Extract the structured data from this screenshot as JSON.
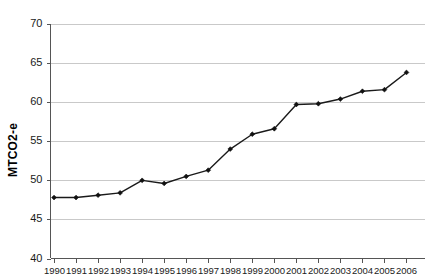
{
  "chart_data": {
    "type": "line",
    "title": "",
    "subtitle": "",
    "xlabel": "",
    "ylabel": "MTCO2-e",
    "ylim": [
      40,
      70
    ],
    "ytick_step": 5,
    "yticks": [
      40,
      45,
      50,
      55,
      60,
      65,
      70
    ],
    "grid": true,
    "legend": "none",
    "marker": "diamond",
    "line_color": "#1a1a1a",
    "grid_color": "#c9c9c9",
    "axis_color": "#555555",
    "background_color": "#ffffff",
    "categories": [
      "1990",
      "1991",
      "1992",
      "1993",
      "1994",
      "1995",
      "1996",
      "1997",
      "1998",
      "1999",
      "2000",
      "2001",
      "2002",
      "2003",
      "2004",
      "2005",
      "2006"
    ],
    "values": [
      47.8,
      47.8,
      48.1,
      48.4,
      50.0,
      49.6,
      50.5,
      51.3,
      54.0,
      55.9,
      56.6,
      59.7,
      59.8,
      60.4,
      61.4,
      61.6,
      63.8
    ],
    "series": [
      {
        "name": "MTCO2-e",
        "values": [
          47.8,
          47.8,
          48.1,
          48.4,
          50.0,
          49.6,
          50.5,
          51.3,
          54.0,
          55.9,
          56.6,
          59.7,
          59.8,
          60.4,
          61.4,
          61.6,
          63.8
        ]
      }
    ],
    "annotations": []
  }
}
